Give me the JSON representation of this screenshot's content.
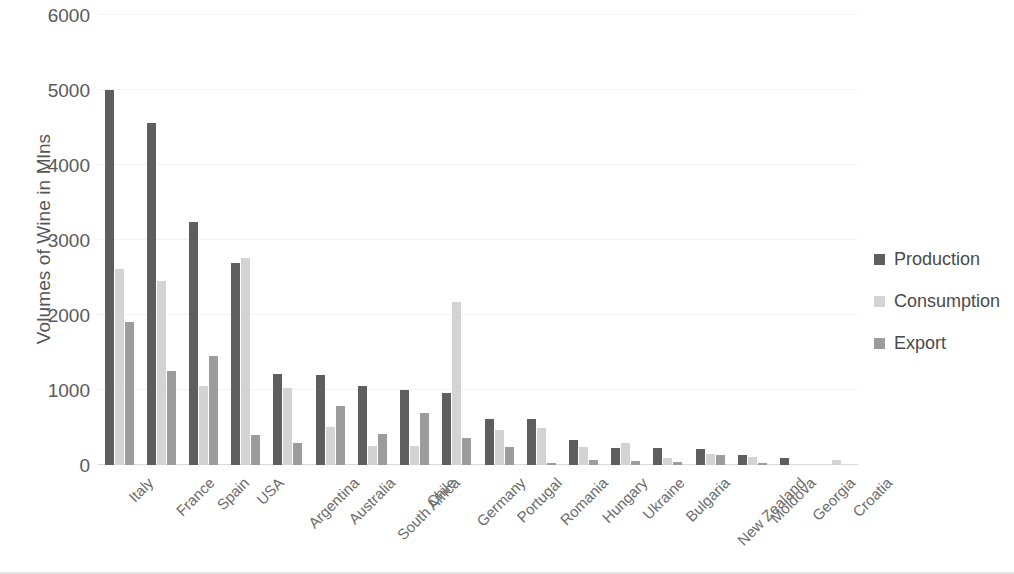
{
  "chart_data": {
    "type": "bar",
    "title": "",
    "xlabel": "",
    "ylabel": "Volumes of Wine in Mlns",
    "ylim": [
      0,
      6000
    ],
    "yticks": [
      0,
      1000,
      2000,
      3000,
      4000,
      5000,
      6000
    ],
    "ytick_labels": [
      "0",
      "1000",
      "2000",
      "3000",
      "4000",
      "5000",
      "6000"
    ],
    "grid": true,
    "legend_position": "right",
    "categories": [
      "Italy",
      "France",
      "Spain",
      "USA",
      "Argentina",
      "Australia",
      "South Africa",
      "Chile",
      "Germany",
      "Portugal",
      "Romania",
      "Hungary",
      "Ukraine",
      "Bulgaria",
      "New Zealand",
      "Moldova",
      "Georgia",
      "Croatia"
    ],
    "series": [
      {
        "name": "Production",
        "color": "#5e5e5e",
        "values": [
          5000,
          4560,
          3240,
          2700,
          1220,
          1200,
          1060,
          1000,
          965,
          620,
          620,
          330,
          230,
          230,
          210,
          140,
          100,
          0
        ]
      },
      {
        "name": "Consumption",
        "color": "#d3d3d3",
        "values": [
          2620,
          2450,
          1060,
          2760,
          1030,
          510,
          260,
          250,
          2170,
          470,
          500,
          240,
          290,
          90,
          150,
          110,
          0,
          70
        ]
      },
      {
        "name": "Export",
        "color": "#9c9c9c",
        "values": [
          1910,
          1250,
          1460,
          400,
          290,
          790,
          420,
          700,
          360,
          240,
          30,
          70,
          50,
          40,
          140,
          30,
          0,
          0
        ]
      }
    ]
  },
  "legend": {
    "items": [
      {
        "label": "Production",
        "swatch": "legend-swatch-production"
      },
      {
        "label": "Consumption",
        "swatch": "legend-swatch-consumption"
      },
      {
        "label": "Export",
        "swatch": "legend-swatch-export"
      }
    ]
  },
  "colors": {
    "production": "#5e5e5e",
    "consumption": "#d3d3d3",
    "export": "#9c9c9c",
    "gridline": "#f2f2f2",
    "axis": "#d9d9d9",
    "text": "#595959"
  }
}
